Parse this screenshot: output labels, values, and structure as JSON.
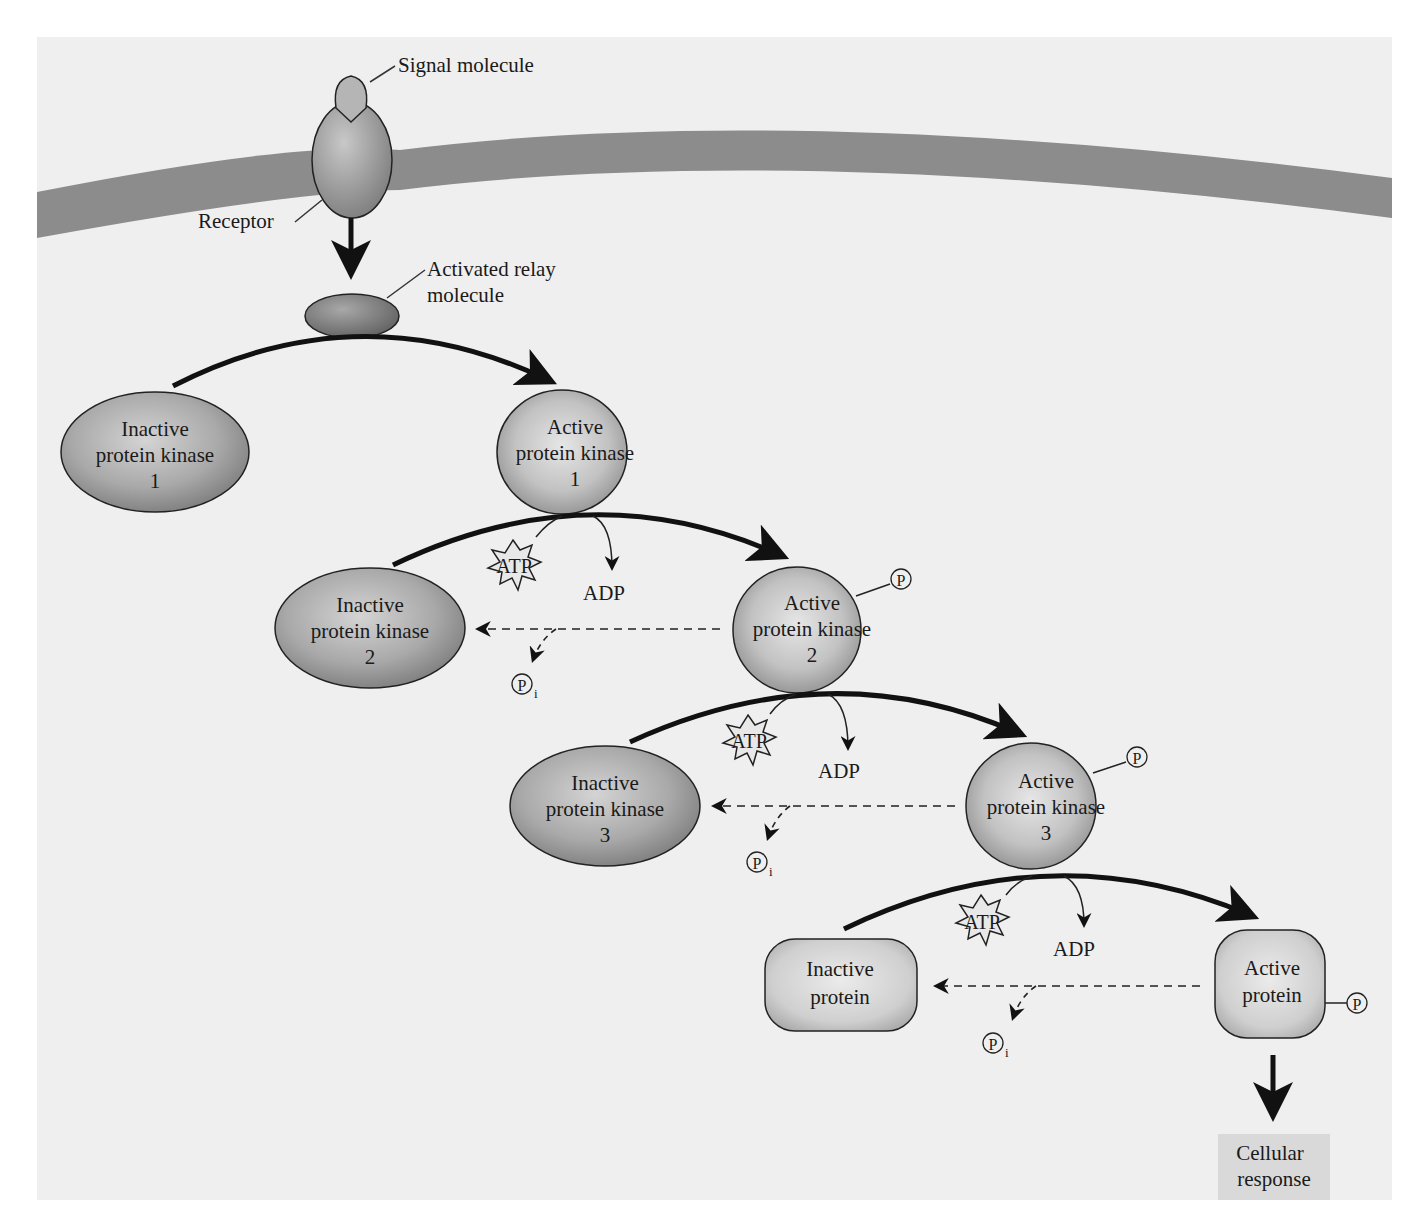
{
  "colors": {
    "background": "#efefef",
    "membrane": "#8c8c8c",
    "protein_fill": "#a8a8a8",
    "active_protein_fill": "#c4c4c4",
    "response_box": "#d9d9d9",
    "arrow": "#111111"
  },
  "membrane": {
    "signal_label": "Signal molecule",
    "receptor_label": "Receptor",
    "relay_label_line1": "Activated relay",
    "relay_label_line2": "molecule"
  },
  "cascade": [
    {
      "inactive": {
        "line1": "Inactive",
        "line2": "protein kinase",
        "line3": "1"
      },
      "active": {
        "line1": "Active",
        "line2": "protein kinase",
        "line3": "1"
      }
    },
    {
      "inactive": {
        "line1": "Inactive",
        "line2": "protein kinase",
        "line3": "2"
      },
      "active": {
        "line1": "Active",
        "line2": "protein kinase",
        "line3": "2"
      },
      "atp": "ATP",
      "adp": "ADP",
      "phosphate": "P",
      "pi": "P",
      "pi_sub": "i"
    },
    {
      "inactive": {
        "line1": "Inactive",
        "line2": "protein kinase",
        "line3": "3"
      },
      "active": {
        "line1": "Active",
        "line2": "protein kinase",
        "line3": "3"
      },
      "atp": "ATP",
      "adp": "ADP",
      "phosphate": "P",
      "pi": "P",
      "pi_sub": "i"
    },
    {
      "inactive": {
        "line1": "Inactive",
        "line2": "protein"
      },
      "active": {
        "line1": "Active",
        "line2": "protein"
      },
      "atp": "ATP",
      "adp": "ADP",
      "phosphate": "P",
      "pi": "P",
      "pi_sub": "i"
    }
  ],
  "response": {
    "line1": "Cellular",
    "line2": "response"
  }
}
